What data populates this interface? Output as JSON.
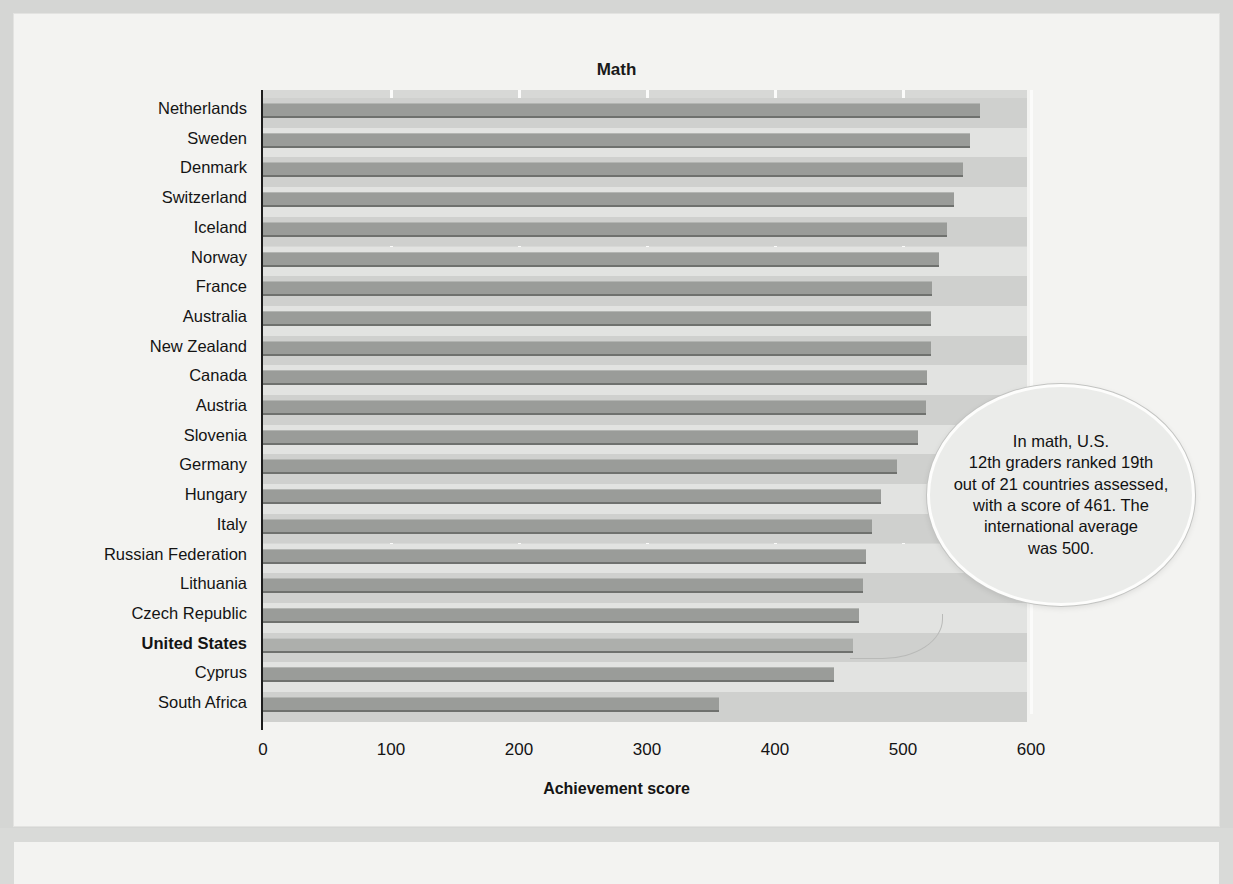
{
  "chart_data": {
    "type": "bar",
    "orientation": "horizontal",
    "title": "Math",
    "xlabel": "Achievement score",
    "ylabel": "",
    "xlim": [
      0,
      630
    ],
    "xticks": [
      0,
      100,
      200,
      300,
      400,
      500,
      600
    ],
    "grid": true,
    "legend": null,
    "categories": [
      "Netherlands",
      "Sweden",
      "Denmark",
      "Switzerland",
      "Iceland",
      "Norway",
      "France",
      "Australia",
      "New Zealand",
      "Canada",
      "Austria",
      "Slovenia",
      "Germany",
      "Hungary",
      "Italy",
      "Russian Federation",
      "Lithuania",
      "Czech Republic",
      "United States",
      "Cyprus",
      "South Africa"
    ],
    "values": [
      560,
      552,
      547,
      540,
      534,
      528,
      523,
      522,
      522,
      519,
      518,
      512,
      495,
      483,
      476,
      471,
      469,
      466,
      461,
      446,
      356
    ],
    "highlighted_category": "United States",
    "annotations": [
      {
        "target": "United States",
        "text": "In math, U.S. 12th graders ranked 19th out of 21 countries assessed, with a score of 461. The international average was 500."
      }
    ]
  },
  "chart": {
    "title": "Math",
    "x_axis_label": "Achievement score",
    "x_ticks": [
      "0",
      "100",
      "200",
      "300",
      "400",
      "500",
      "600"
    ]
  },
  "callout": {
    "lines": [
      "In math, U.S.",
      "12th graders ranked 19th",
      "out of 21 countries assessed,",
      "with a score of 461. The",
      "international average",
      "was 500."
    ]
  },
  "colors": {
    "bar": "#9a9c99",
    "bar_edge": "#6f716e",
    "bar_highlight": "#adafac",
    "plot_background": "#d7d8d6",
    "page_background": "#f3f3f1",
    "text": "#141414"
  }
}
